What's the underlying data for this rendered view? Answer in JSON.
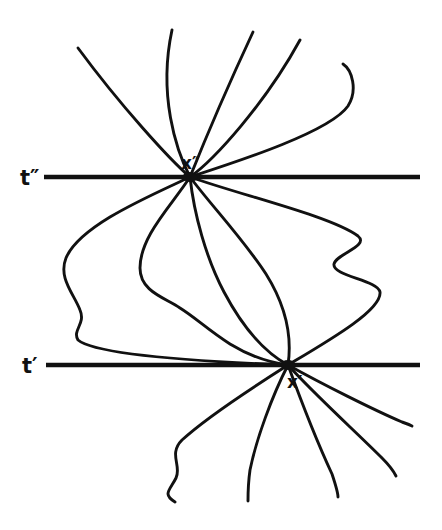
{
  "figure": {
    "type": "diagram",
    "width": 442,
    "height": 530,
    "background_color": "#ffffff",
    "stroke_color": "#111111"
  },
  "time_lines": [
    {
      "id": "t-double-prime",
      "label": "t″",
      "label_x": 20,
      "label_y": 185,
      "y": 177,
      "x_start": 44,
      "x_end": 420,
      "stroke_width": 4.6
    },
    {
      "id": "t-prime",
      "label": "t′",
      "label_x": 22,
      "label_y": 373,
      "y": 365,
      "x_start": 46,
      "x_end": 420,
      "stroke_width": 4.6
    }
  ],
  "vertices": [
    {
      "id": "x-double-prime",
      "label": "x″",
      "x": 190,
      "y": 177,
      "label_x": 181,
      "label_y": 169,
      "dot_rx": 7.5,
      "dot_ry": 5.0
    },
    {
      "id": "x-prime",
      "label": "x′",
      "x": 288,
      "y": 365,
      "label_x": 287,
      "label_y": 388,
      "dot_rx": 7.5,
      "dot_ry": 5.0
    }
  ],
  "paths": {
    "stroke_width": 2.9,
    "upper_fan": [
      {
        "id": "upper-1",
        "d": "M190,177 C170,160 120,105 78,48"
      },
      {
        "id": "upper-2",
        "d": "M190,177 C176,150 158,95 172,30"
      },
      {
        "id": "upper-3",
        "d": "M190,177 C200,152 226,90 253,32"
      },
      {
        "id": "upper-4",
        "d": "M190,177 C214,160 265,104 300,40"
      },
      {
        "id": "upper-5",
        "d": "M190,177 C236,162 330,132 348,106 C358,90 352,70 343,64"
      }
    ],
    "middle_bundle": [
      {
        "id": "middle-1",
        "d": "M190,177 C150,196 80,225 66,258 C58,278 74,294 80,310 C86,324 72,330 78,340 C92,352 160,360 288,365"
      },
      {
        "id": "middle-2",
        "d": "M190,177 C172,205 140,236 140,268 C140,292 166,298 180,308 C196,318 208,330 230,344 C248,355 266,362 288,365"
      },
      {
        "id": "middle-3",
        "d": "M190,177 C194,214 206,258 224,292 C242,326 264,352 288,365"
      },
      {
        "id": "middle-4",
        "d": "M190,177 C210,204 244,240 266,274 C286,306 292,338 288,365"
      },
      {
        "id": "middle-5",
        "d": "M190,177 C244,196 330,216 358,236 C370,246 336,254 334,264 C332,276 378,280 380,292 C382,310 330,340 288,365"
      }
    ],
    "lower_fan": [
      {
        "id": "lower-1",
        "d": "M288,365 C258,384 208,416 182,440 C168,454 182,466 176,478 C170,490 162,494 175,502"
      },
      {
        "id": "lower-2",
        "d": "M288,365 C272,396 256,440 250,470 C248,484 248,494 248,501"
      },
      {
        "id": "lower-3",
        "d": "M288,365 C300,398 318,444 332,474 C336,486 338,492 338,497"
      },
      {
        "id": "lower-4",
        "d": "M288,365 C312,392 356,432 382,458 C390,466 394,472 396,476"
      },
      {
        "id": "lower-5",
        "d": "M288,365 C322,384 374,410 402,422 C408,424 410,425 412,426"
      }
    ]
  }
}
